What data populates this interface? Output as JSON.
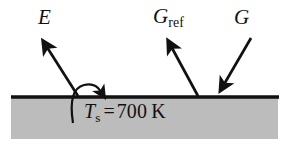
{
  "figure": {
    "type": "thermal-radiation-surface-diagram",
    "width": 288,
    "height": 143,
    "background_color": "#ffffff"
  },
  "surface": {
    "name": "opaque-surface",
    "line_color": "#111111",
    "fill_color": "#bcbcbc",
    "line_y": 97,
    "line_x_start": 11,
    "line_x_end": 279,
    "block_top": 99,
    "block_bottom": 139
  },
  "labels": {
    "emission": {
      "symbol": "E",
      "subscript": "",
      "style": "italic"
    },
    "reflected_irradiation": {
      "symbol": "G",
      "subscript": "ref",
      "style": "italic"
    },
    "irradiation": {
      "symbol": "G",
      "subscript": "",
      "style": "italic"
    },
    "surface_temperature": {
      "symbol": "T",
      "subscript": "s",
      "equals": "=",
      "value": "700",
      "unit": "K",
      "full_text": "Ts = 700 K"
    }
  },
  "arrows": [
    {
      "name": "emission-arrow",
      "label": "E",
      "direction": "outgoing-up-left",
      "tail": {
        "x": 78,
        "y": 96
      },
      "head": {
        "x": 44,
        "y": 43
      },
      "color": "#111111"
    },
    {
      "name": "reflected-irradiation-arrow",
      "label": "Gref",
      "direction": "outgoing-up-left",
      "tail": {
        "x": 198,
        "y": 96
      },
      "head": {
        "x": 169,
        "y": 43
      },
      "color": "#111111"
    },
    {
      "name": "irradiation-arrow",
      "label": "G",
      "direction": "incoming-down-left",
      "tail": {
        "x": 251,
        "y": 38
      },
      "head": {
        "x": 221,
        "y": 89
      },
      "color": "#111111"
    },
    {
      "name": "temperature-pointer-arrow",
      "label": "Ts pointer",
      "direction": "curved-hook-to-surface",
      "tail": {
        "x": 73,
        "y": 122
      },
      "head": {
        "x": 103,
        "y": 94
      },
      "color": "#111111"
    }
  ],
  "colors": {
    "ink": "#111111",
    "surface_gray": "#bcbcbc",
    "background": "#ffffff"
  }
}
